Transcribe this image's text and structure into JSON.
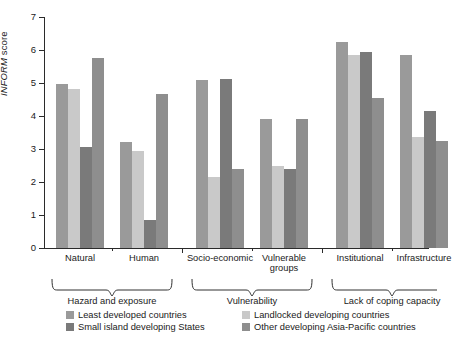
{
  "chart_data": {
    "type": "bar",
    "title": "",
    "xlabel": "",
    "ylabel": "INFORM score",
    "ylabel_italic_part": "INFORM",
    "ylabel_plain_part": " score",
    "ylim": [
      0,
      7
    ],
    "yticks": [
      0,
      1,
      2,
      3,
      4,
      5,
      6,
      7
    ],
    "grid": false,
    "legend_position": "bottom",
    "categories": [
      "Natural",
      "Human",
      "Socio-economic",
      "Vulnerable groups",
      "Institutional",
      "Infrastructure"
    ],
    "category_groups": [
      {
        "label": "Hazard and exposure",
        "categories": [
          "Natural",
          "Human"
        ]
      },
      {
        "label": "Vulnerability",
        "categories": [
          "Socio-economic",
          "Vulnerable groups"
        ]
      },
      {
        "label": "Lack of coping capacity",
        "categories": [
          "Institutional",
          "Infrastructure"
        ]
      }
    ],
    "series": [
      {
        "name": "Least developed countries",
        "color": "#9a9a9a",
        "values": [
          4.97,
          3.2,
          5.1,
          3.9,
          6.25,
          5.85
        ]
      },
      {
        "name": "Landlocked developing countries",
        "color": "#c9c9c9",
        "values": [
          4.83,
          2.93,
          2.15,
          2.5,
          5.85,
          3.35
        ]
      },
      {
        "name": "Small island developing States",
        "color": "#7a7a7a",
        "values": [
          3.07,
          0.85,
          5.13,
          2.4,
          5.95,
          4.15
        ]
      },
      {
        "name": "Other developing Asia-Pacific countries",
        "color": "#8e8e8e",
        "values": [
          5.75,
          4.68,
          2.4,
          3.9,
          4.55,
          3.25
        ]
      }
    ]
  },
  "legend": {
    "items": [
      {
        "label": "Least developed countries"
      },
      {
        "label": "Landlocked developing countries"
      },
      {
        "label": "Small island developing States"
      },
      {
        "label": "Other developing Asia-Pacific countries"
      }
    ]
  },
  "axis": {
    "y_tick_labels": [
      "0",
      "1",
      "2",
      "3",
      "4",
      "5",
      "6",
      "7"
    ]
  }
}
